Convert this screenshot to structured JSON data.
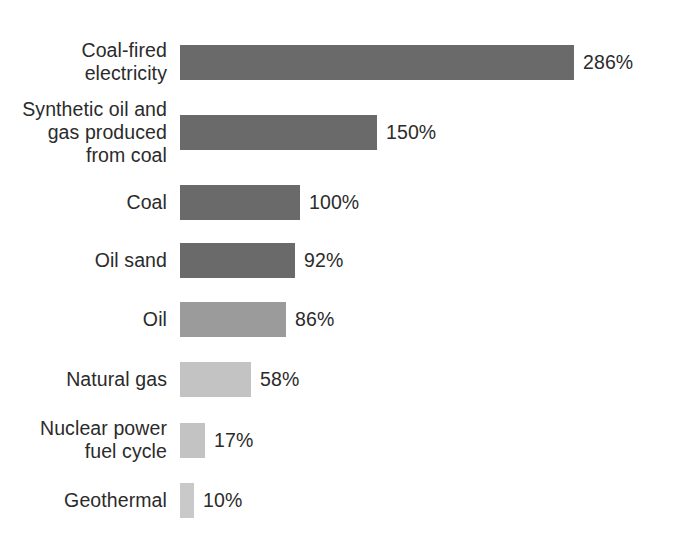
{
  "chart_data": {
    "type": "bar",
    "orientation": "horizontal",
    "title": "",
    "subtitle": "",
    "xlabel": "",
    "ylabel": "",
    "grid": false,
    "legend": "none",
    "axis_visible": false,
    "value_suffix": "%",
    "xlim": [
      0,
      286
    ],
    "categories": [
      "Coal-fired\nelectricity",
      "Synthetic oil and\ngas produced\nfrom coal",
      "Coal",
      "Oil sand",
      "Oil",
      "Natural gas",
      "Nuclear power\nfuel cycle",
      "Geothermal"
    ],
    "values": [
      286,
      150,
      100,
      92,
      86,
      58,
      17,
      10
    ],
    "value_labels": [
      "286%",
      "150%",
      "100%",
      "92%",
      "86%",
      "58%",
      "17%",
      "10%"
    ],
    "bar_pixel_widths": [
      394,
      197,
      120,
      115,
      106,
      71,
      25,
      14
    ],
    "bar_shades": [
      "dark",
      "dark",
      "dark",
      "dark",
      "mid",
      "light",
      "light",
      "lighter"
    ],
    "colors": {
      "dark": "#6a6a6a",
      "mid": "#9b9b9b",
      "light": "#c3c3c3",
      "lighter": "#c9c9c9",
      "text": "#2b2b2b",
      "background": "#ffffff"
    },
    "rows": [
      {
        "label": "Coal-fired\nelectricity",
        "value": 286,
        "value_label": "286%",
        "width_px": 394,
        "shade": "dark",
        "top_px": 40
      },
      {
        "label": "Synthetic oil and\ngas produced\nfrom coal",
        "value": 150,
        "value_label": "150%",
        "width_px": 197,
        "shade": "dark",
        "top_px": 110
      },
      {
        "label": "Coal",
        "value": 100,
        "value_label": "100%",
        "width_px": 120,
        "shade": "dark",
        "top_px": 180
      },
      {
        "label": "Oil sand",
        "value": 92,
        "value_label": "92%",
        "width_px": 115,
        "shade": "dark",
        "top_px": 238
      },
      {
        "label": "Oil",
        "value": 86,
        "value_label": "86%",
        "width_px": 106,
        "shade": "mid",
        "top_px": 297
      },
      {
        "label": "Natural gas",
        "value": 58,
        "value_label": "58%",
        "width_px": 71,
        "shade": "light",
        "top_px": 357
      },
      {
        "label": "Nuclear power\nfuel cycle",
        "value": 17,
        "value_label": "17%",
        "width_px": 25,
        "shade": "light",
        "top_px": 418
      },
      {
        "label": "Geothermal",
        "value": 10,
        "value_label": "10%",
        "width_px": 14,
        "shade": "lighter",
        "top_px": 478
      }
    ]
  }
}
